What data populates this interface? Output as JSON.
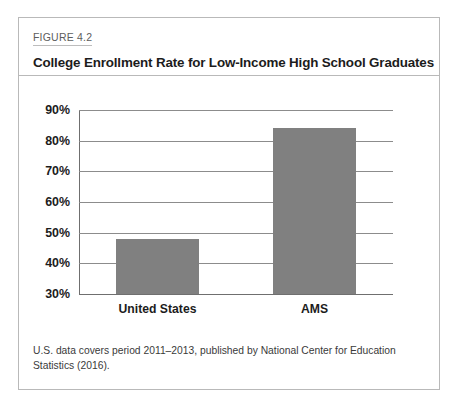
{
  "figure": {
    "number_label": "FIGURE 4.2",
    "title": "College Enrollment Rate for Low-Income High School Graduates",
    "note": "U.S. data covers period 2011–2013, published by National Center for Education Statistics (2016)."
  },
  "colors": {
    "bar_fill": "#808080",
    "gridline": "#8c8c8c",
    "axis": "#6f6f6f",
    "frame": "#b9b9b9",
    "text": "#1c1c1c"
  },
  "chart_data": {
    "type": "bar",
    "title": "College Enrollment Rate for Low-Income High School Graduates",
    "xlabel": "",
    "ylabel": "",
    "categories": [
      "United States",
      "AMS"
    ],
    "values": [
      48,
      84
    ],
    "ylim": [
      30,
      90
    ],
    "yticks": [
      30,
      40,
      50,
      60,
      70,
      80,
      90
    ],
    "ytick_labels": [
      "30%",
      "40%",
      "50%",
      "60%",
      "70%",
      "80%",
      "90%"
    ],
    "grid": true,
    "legend": null,
    "value_unit": "percent"
  }
}
